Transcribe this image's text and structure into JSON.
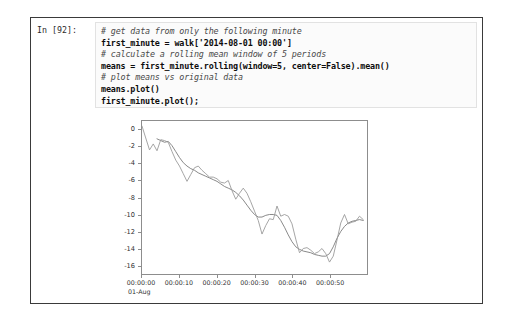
{
  "cell": {
    "prompt": "In [92]:",
    "code_lines": [
      {
        "text": "# get data from only the following minute",
        "kind": "comment"
      },
      {
        "text": "first_minute = walk['2014-08-01 00:00']",
        "kind": "stmt"
      },
      {
        "text": "# calculate a rolling mean window of 5 periods",
        "kind": "comment"
      },
      {
        "text": "means = first_minute.rolling(window=5, center=False).mean()",
        "kind": "stmt"
      },
      {
        "text": "# plot means vs original data",
        "kind": "comment"
      },
      {
        "text": "means.plot()",
        "kind": "stmt"
      },
      {
        "text": "first_minute.plot();",
        "kind": "stmt"
      }
    ]
  },
  "chart_data": {
    "type": "line",
    "title": "",
    "xlabel": "",
    "ylabel": "",
    "grid": false,
    "legend": "none",
    "ylim": [
      -17,
      1
    ],
    "xlim": [
      0,
      60
    ],
    "ytick_labels": [
      "0",
      "-2",
      "-4",
      "-6",
      "-8",
      "-10",
      "-12",
      "-14",
      "-16"
    ],
    "ytick_values": [
      0,
      -2,
      -4,
      -6,
      -8,
      -10,
      -12,
      -14,
      -16
    ],
    "xtick_labels": [
      "00:00:00",
      "00:00:10",
      "00:00:20",
      "00:00:30",
      "00:00:40",
      "00:00:50"
    ],
    "xtick_values": [
      0,
      10,
      20,
      30,
      40,
      50
    ],
    "xaxis_date_label": "01-Aug",
    "series": [
      {
        "name": "means",
        "color": "#7a7a7a",
        "x": [
          0,
          1,
          2,
          3,
          4,
          5,
          6,
          7,
          8,
          9,
          10,
          11,
          12,
          13,
          14,
          15,
          16,
          17,
          18,
          19,
          20,
          21,
          22,
          23,
          24,
          25,
          26,
          27,
          28,
          29,
          30,
          31,
          32,
          33,
          34,
          35,
          36,
          37,
          38,
          39,
          40,
          41,
          42,
          43,
          44,
          45,
          46,
          47,
          48,
          49,
          50,
          51,
          52,
          53,
          54,
          55,
          56,
          57,
          58,
          59
        ],
        "y": [
          null,
          null,
          null,
          null,
          -1.1,
          -1.3,
          -1.5,
          -1.4,
          -1.9,
          -2.6,
          -3.3,
          -3.9,
          -4.3,
          -4.6,
          -4.8,
          -5.1,
          -5.3,
          -5.5,
          -5.7,
          -5.9,
          -6.1,
          -6.4,
          -6.7,
          -6.9,
          -7.1,
          -7.4,
          -7.8,
          -8.3,
          -8.9,
          -9.5,
          -10.0,
          -10.3,
          -10.3,
          -10.1,
          -10.0,
          -10.0,
          -10.1,
          -10.7,
          -11.5,
          -12.4,
          -13.2,
          -13.8,
          -14.1,
          -14.3,
          -14.4,
          -14.5,
          -14.7,
          -14.8,
          -14.9,
          -14.9,
          -14.6,
          -13.8,
          -12.8,
          -12.0,
          -11.4,
          -11.0,
          -10.8,
          -10.7,
          -10.6,
          -10.7
        ]
      },
      {
        "name": "first_minute",
        "color": "#9a9a9a",
        "x": [
          0,
          1,
          2,
          3,
          4,
          5,
          6,
          7,
          8,
          9,
          10,
          11,
          12,
          13,
          14,
          15,
          16,
          17,
          18,
          19,
          20,
          21,
          22,
          23,
          24,
          25,
          26,
          27,
          28,
          29,
          30,
          31,
          32,
          33,
          34,
          35,
          36,
          37,
          38,
          39,
          40,
          41,
          42,
          43,
          44,
          45,
          46,
          47,
          48,
          49,
          50,
          51,
          52,
          53,
          54,
          55,
          56,
          57,
          58,
          59
        ],
        "y": [
          0.4,
          -1.0,
          -2.4,
          -1.7,
          -2.5,
          -1.2,
          -1.3,
          -1.5,
          -2.6,
          -3.6,
          -4.3,
          -5.2,
          -6.1,
          -5.3,
          -4.5,
          -4.3,
          -4.8,
          -5.2,
          -5.6,
          -5.6,
          -5.8,
          -6.2,
          -6.3,
          -6.0,
          -7.2,
          -8.2,
          -7.5,
          -6.9,
          -7.5,
          -8.5,
          -9.6,
          -10.7,
          -12.3,
          -11.3,
          -10.5,
          -10.6,
          -9.0,
          -10.2,
          -10.0,
          -10.2,
          -11.1,
          -12.9,
          -14.5,
          -14.0,
          -13.9,
          -14.2,
          -14.6,
          -14.4,
          -14.0,
          -14.6,
          -15.6,
          -14.9,
          -13.0,
          -11.0,
          -10.0,
          -11.1,
          -10.9,
          -10.8,
          -10.2,
          -10.6
        ]
      }
    ]
  }
}
